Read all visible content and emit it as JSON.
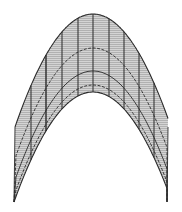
{
  "figure": {
    "title": "Parabolic arch surface mesh",
    "colors": {
      "background": "#ffffff",
      "fill": "#c8c8c8",
      "hatch": "#9a9a9a",
      "stroke": "#2a2a2a"
    },
    "apex": {
      "x": 93,
      "y": 14
    },
    "outer_left_top": {
      "x": 15,
      "y": 127
    },
    "outer_right_top": {
      "x": 168,
      "y": 127
    },
    "tip_left": {
      "x": 14,
      "y": 202
    },
    "tip_right": {
      "x": 167,
      "y": 202
    },
    "inner_apex": {
      "x": 93,
      "y": 92
    },
    "contour_apex_y": [
      14,
      48,
      71,
      85,
      92
    ],
    "vertical_rulings_x": [
      31,
      46,
      62,
      78,
      93,
      109,
      124,
      139,
      154
    ]
  }
}
